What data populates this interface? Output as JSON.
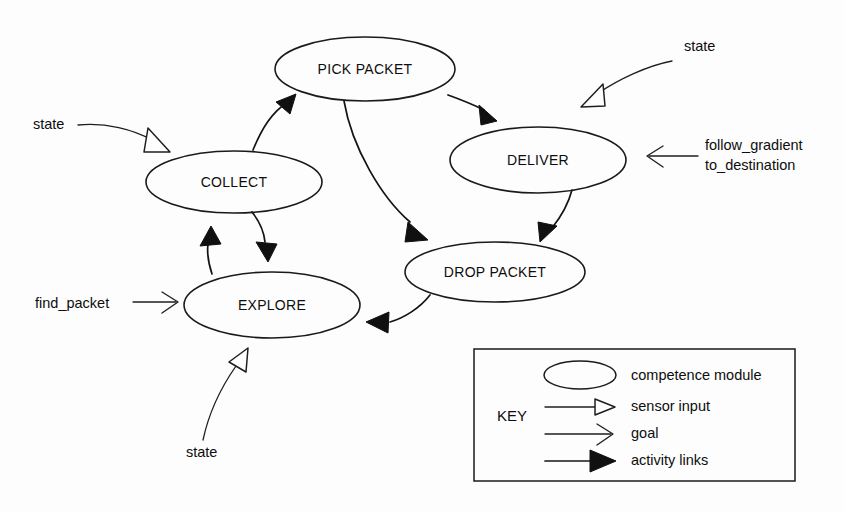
{
  "diagram": {
    "background_color": "#fdfdfd",
    "stroke_color": "#141414",
    "nodes": [
      {
        "id": "pick_packet",
        "label": "PICK PACKET",
        "cx": 365,
        "cy": 69,
        "rx": 90,
        "ry": 32
      },
      {
        "id": "collect",
        "label": "COLLECT",
        "cx": 234,
        "cy": 182,
        "rx": 88,
        "ry": 31
      },
      {
        "id": "deliver",
        "label": "DELIVER",
        "cx": 538,
        "cy": 160,
        "rx": 88,
        "ry": 33
      },
      {
        "id": "drop_packet",
        "label": "DROP PACKET",
        "cx": 495,
        "cy": 272,
        "rx": 90,
        "ry": 30
      },
      {
        "id": "explore",
        "label": "EXPLORE",
        "cx": 272,
        "cy": 305,
        "rx": 88,
        "ry": 33
      }
    ],
    "activity_links": [
      {
        "id": "collect-to-pick-packet",
        "from": "collect",
        "to": "pick_packet"
      },
      {
        "id": "pick-packet-to-deliver",
        "from": "pick_packet",
        "to": "deliver"
      },
      {
        "id": "pick-packet-to-drop-packet",
        "from": "pick_packet",
        "to": "drop_packet"
      },
      {
        "id": "deliver-to-drop-packet",
        "from": "deliver",
        "to": "drop_packet"
      },
      {
        "id": "drop-packet-to-explore",
        "from": "drop_packet",
        "to": "explore"
      },
      {
        "id": "explore-to-collect",
        "from": "explore",
        "to": "collect"
      },
      {
        "id": "collect-to-explore",
        "from": "collect",
        "to": "explore"
      }
    ],
    "sensor_inputs": [
      {
        "id": "sensor-state-collect",
        "label": "state",
        "target": "collect",
        "label_x": 33,
        "label_y": 129
      },
      {
        "id": "sensor-state-deliver",
        "label": "state",
        "target": "deliver",
        "label_x": 684,
        "label_y": 51
      },
      {
        "id": "sensor-state-explore",
        "label": "state",
        "target": "explore",
        "label_x": 186,
        "label_y": 457
      }
    ],
    "goals": [
      {
        "id": "goal-find-packet",
        "label": "find_packet",
        "target": "explore",
        "label_x": 35,
        "label_y": 308
      },
      {
        "id": "goal-follow-gradient",
        "label_line1": "follow_gradient",
        "label_line2": "to_destination",
        "target": "deliver",
        "label_x": 705,
        "label_y": 150
      }
    ]
  },
  "key": {
    "title": "KEY",
    "box": {
      "x": 474,
      "y": 349,
      "width": 321,
      "height": 132
    },
    "entries": [
      {
        "id": "competence-module",
        "symbol": "ellipse",
        "label": "competence module"
      },
      {
        "id": "sensor-input",
        "symbol": "hollow-arrow",
        "label": "sensor input"
      },
      {
        "id": "goal",
        "symbol": "open-arrow",
        "label": "goal"
      },
      {
        "id": "activity-links",
        "symbol": "solid-arrow",
        "label": "activity links"
      }
    ]
  }
}
